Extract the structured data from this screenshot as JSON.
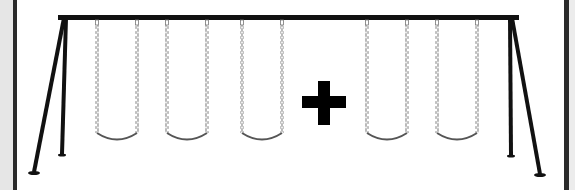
{
  "image": {
    "subject": "swing set illustration",
    "description": "A-frame swing set with five swings and a plus sign between the third and fourth swings",
    "swing_count": 5,
    "symbol": "+"
  },
  "colors": {
    "frame": "#111111",
    "chain": "#888888",
    "seat": "#555555",
    "plus": "#000000",
    "border": "#2a2a2a",
    "background": "#ffffff"
  },
  "swings": [
    {
      "left_x": 97,
      "right_x": 137
    },
    {
      "left_x": 167,
      "right_x": 207
    },
    {
      "left_x": 242,
      "right_x": 282
    },
    {
      "left_x": 367,
      "right_x": 407
    },
    {
      "left_x": 437,
      "right_x": 477
    }
  ]
}
